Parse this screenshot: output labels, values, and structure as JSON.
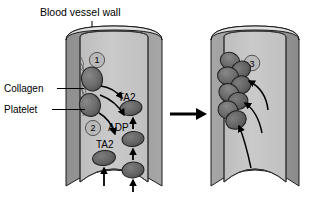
{
  "figure": {
    "title": "Blood vessel wall",
    "labels": {
      "collagen": "Collagen",
      "platelet": "Platelet"
    },
    "molecules": {
      "txa2_upper": "TA2",
      "adp": "ADP",
      "txa2_lower": "TA2"
    },
    "steps": {
      "one": "1",
      "two": "2",
      "three": "3"
    },
    "colors": {
      "wall": "#9e9e9e",
      "wall_dark": "#8a8a8a",
      "lumen": "#c4c4c4",
      "lumen_light": "#d2d2d2",
      "rim": "#dcdcdc",
      "platelet": "#6a6a6a",
      "platelet_edge": "#2a2a2a",
      "marker": "#b8b8b8",
      "outline": "#1a1a1a",
      "arrow": "#000000"
    },
    "panels": {
      "left_name": "adhesion-and-activation-panel",
      "right_name": "aggregation-panel",
      "transition_arrow": "transition-arrow"
    },
    "counts": {
      "left_platelets": 7,
      "aggregate_platelets": 8,
      "flow_arrows": 2,
      "recruitment_arrows": 3
    }
  }
}
